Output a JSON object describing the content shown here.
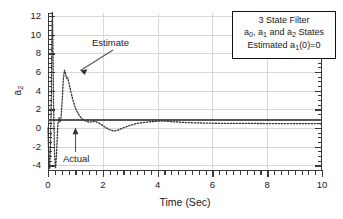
{
  "chart_data": {
    "type": "line",
    "title": "",
    "xlabel": "Time (Sec)",
    "ylabel": "a2",
    "ylabel_base": "a",
    "ylabel_sub": "2",
    "xlim": [
      0,
      10
    ],
    "ylim": [
      -4.5,
      12.3
    ],
    "grid": true,
    "x_ticks": [
      0,
      2,
      4,
      6,
      8,
      10
    ],
    "x_tick_labels": [
      "0",
      "2",
      "4",
      "6",
      "8",
      "10"
    ],
    "x_minor_interval": 0.25,
    "y_ticks": [
      -4,
      -2,
      0,
      2,
      4,
      6,
      8,
      10,
      12
    ],
    "y_tick_labels": [
      "-4",
      "-2",
      "0",
      "2",
      "4",
      "6",
      "8",
      "10",
      "12"
    ],
    "y_minor_interval": 0.5,
    "legend_position": "top-right",
    "series": [
      {
        "name": "Actual",
        "style": "solid",
        "color": "#555555",
        "width": 2.0,
        "x": [
          0,
          10
        ],
        "values": [
          0.85,
          0.85
        ]
      },
      {
        "name": "Estimate",
        "style": "dotted",
        "color": "#333333",
        "width": 1.3,
        "x": [
          0.0,
          0.03,
          0.06,
          0.09,
          0.12,
          0.14,
          0.16,
          0.18,
          0.2,
          0.24,
          0.28,
          0.32,
          0.36,
          0.4,
          0.44,
          0.48,
          0.52,
          0.56,
          0.6,
          0.64,
          0.68,
          0.72,
          0.78,
          0.84,
          0.9,
          0.96,
          1.02,
          1.1,
          1.2,
          1.3,
          1.4,
          1.5,
          1.6,
          1.7,
          1.8,
          1.9,
          2.0,
          2.1,
          2.2,
          2.3,
          2.4,
          2.5,
          2.6,
          2.7,
          2.85,
          3.0,
          3.2,
          3.4,
          3.6,
          3.8,
          4.0,
          4.2,
          4.4,
          4.6,
          4.8,
          5.0,
          5.4,
          5.8,
          6.2,
          6.6,
          7.0,
          7.5,
          8.0,
          8.5,
          9.0,
          9.5,
          10.0
        ],
        "values": [
          0.0,
          -3.6,
          -4.4,
          -2.0,
          3.0,
          9.0,
          12.4,
          9.0,
          3.0,
          -3.0,
          -4.3,
          -2.2,
          0.4,
          1.1,
          0.6,
          1.2,
          3.0,
          5.2,
          6.2,
          5.8,
          5.3,
          5.35,
          4.6,
          3.8,
          3.1,
          2.5,
          2.0,
          1.55,
          1.1,
          0.85,
          0.7,
          0.62,
          0.65,
          0.72,
          0.6,
          0.45,
          0.25,
          0.05,
          -0.12,
          -0.25,
          -0.32,
          -0.28,
          -0.18,
          -0.05,
          0.12,
          0.28,
          0.45,
          0.55,
          0.62,
          0.68,
          0.72,
          0.74,
          0.7,
          0.66,
          0.62,
          0.58,
          0.54,
          0.52,
          0.5,
          0.49,
          0.48,
          0.48,
          0.47,
          0.47,
          0.46,
          0.46,
          0.45
        ]
      }
    ],
    "annotations": [
      {
        "text": "Estimate",
        "x_text": 1.5,
        "y_text": 8.6,
        "x_point": 0.72,
        "y_point": 5.6
      },
      {
        "text": "Actual",
        "x_text": 0.6,
        "y_text": -2.3,
        "x_point": 0.98,
        "y_point": 0.75
      }
    ]
  },
  "legend": {
    "line1": "3 State Filter",
    "line2_pre": "a",
    "line2_sub1": "0",
    "line2_mid": ", a",
    "line2_sub2": "1",
    "line2_mid2": " and a",
    "line2_sub3": "2",
    "line2_post": " States",
    "line3_pre": "Estimated a",
    "line3_sub": "1",
    "line3_post": "(0)=0",
    "line1_full": "3 State Filter",
    "line2_full": "a0, a1 and a2 States",
    "line3_full": "Estimated a1(0)=0"
  }
}
